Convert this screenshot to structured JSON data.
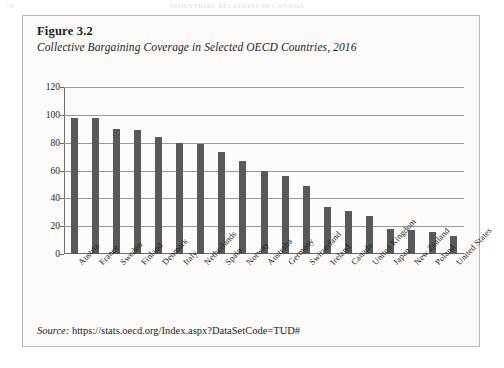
{
  "page_header": {
    "page_number": "78",
    "running_title": "INDUSTRIAL RELATIONS IN CANADA"
  },
  "figure": {
    "number_label": "Figure 3.2",
    "title": "Collective Bargaining Coverage in Selected OECD Countries, 2016",
    "source_lead": "Source:",
    "source_url": "https://stats.oecd.org/Index.aspx?DataSetCode=TUD#"
  },
  "chart_data": {
    "type": "bar",
    "title": "Collective Bargaining Coverage in Selected OECD Countries, 2016",
    "xlabel": "",
    "ylabel": "",
    "ylim": [
      0,
      120
    ],
    "yticks": [
      0,
      20,
      40,
      60,
      80,
      100,
      120
    ],
    "grid": true,
    "legend": "none",
    "categories": [
      "Austria",
      "France",
      "Sweden",
      "Finland",
      "Denmark",
      "Italy",
      "Netherlands",
      "Spain",
      "Norway",
      "Australia",
      "Germany",
      "Switzerland",
      "Ireland",
      "Canada",
      "United Kingdom",
      "Japan",
      "New Zealand",
      "Poland",
      "United States"
    ],
    "values": [
      98,
      98,
      90,
      89,
      84,
      80,
      79,
      73,
      67,
      60,
      56,
      49,
      34,
      31,
      27,
      18,
      17,
      16,
      13
    ],
    "bar_color": "#595959"
  }
}
